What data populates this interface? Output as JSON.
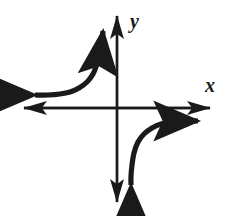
{
  "figure": {
    "title": "",
    "background_color": "#ffffff",
    "ink_color": "#1a1a1a"
  },
  "axes": {
    "x_axis": {
      "label": "x",
      "label_x": 205,
      "label_y": 92,
      "label_size": 20,
      "start_x": 24,
      "end_x": 210,
      "y": 108,
      "stroke_width": 2.4,
      "arrow_start": true,
      "arrow_end": true
    },
    "y_axis": {
      "label": "y",
      "label_x": 130,
      "label_y": 28,
      "label_size": 20,
      "x": 117,
      "start_y": 202,
      "end_y": 16,
      "stroke_width": 2.4,
      "arrow_start": true,
      "arrow_end": true
    },
    "origin": {
      "x": 117,
      "y": 108
    }
  },
  "chart_data": {
    "type": "line",
    "title": "",
    "xlabel": "x",
    "ylabel": "y",
    "grid": false,
    "legend": null,
    "xlim": [
      -6,
      6
    ],
    "ylim": [
      -6,
      6
    ],
    "annotations": [
      "vertical asymptote at x = 0",
      "horizontal asymptote at y = 0"
    ],
    "series": [
      {
        "name": "upper-left branch",
        "quadrant": 2,
        "stroke_width": 5.2,
        "arrow_start": true,
        "arrow_end": true,
        "points": [
          [
            35,
            95
          ],
          [
            48,
            95
          ],
          [
            60,
            94
          ],
          [
            70,
            92
          ],
          [
            79,
            88
          ],
          [
            87,
            82
          ],
          [
            93,
            74
          ],
          [
            97,
            64
          ],
          [
            100,
            52
          ],
          [
            102,
            40
          ],
          [
            103,
            31
          ]
        ]
      },
      {
        "name": "lower-right branch",
        "quadrant": 4,
        "stroke_width": 5.2,
        "arrow_start": true,
        "arrow_end": true,
        "points": [
          [
            131,
            185
          ],
          [
            131,
            176
          ],
          [
            132,
            165
          ],
          [
            134,
            153
          ],
          [
            138,
            142
          ],
          [
            144,
            134
          ],
          [
            152,
            128
          ],
          [
            161,
            124
          ],
          [
            172,
            122
          ],
          [
            185,
            121
          ],
          [
            198,
            121
          ]
        ]
      }
    ]
  },
  "arrowheads": {
    "curve_arrow_label": "large-solid-triangle",
    "axis_arrow_label": "slim-solid-triangle",
    "curve_arrow_width": 17,
    "curve_arrow_length": 20,
    "axis_arrow_width": 11,
    "axis_arrow_length": 18
  }
}
